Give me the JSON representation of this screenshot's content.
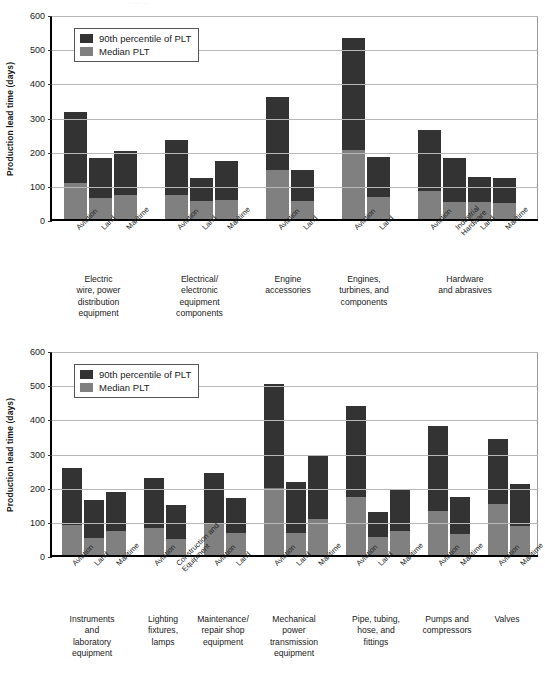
{
  "page": {
    "background": "#ffffff",
    "faint_top_text": "· ···· ··"
  },
  "colors": {
    "percentile90": "#333333",
    "median": "#808080",
    "gridline": "#b8b8b8",
    "axis": "#000000"
  },
  "legend": {
    "series_90": "90th percentile of PLT",
    "series_median": "Median PLT"
  },
  "chart_data": [
    {
      "type": "bar",
      "chart_id": "chart-top",
      "title": "",
      "xlabel": "",
      "ylabel": "Production lead time (days)",
      "ylim": [
        0,
        600
      ],
      "yticks": [
        0,
        100,
        200,
        300,
        400,
        500,
        600
      ],
      "grid": true,
      "stacked_overlay": true,
      "legend_position": "top-left",
      "series": [
        {
          "name": "90th percentile of PLT",
          "color": "#333333"
        },
        {
          "name": "Median PLT",
          "color": "#808080"
        }
      ],
      "groups": [
        {
          "label": "Electric\nwire, power\ndistribution\nequipment",
          "bars": [
            {
              "category": "Aviation",
              "p90": 312,
              "median": 105
            },
            {
              "category": "Land",
              "p90": 178,
              "median": 61
            },
            {
              "category": "Maritime",
              "p90": 198,
              "median": 69
            }
          ]
        },
        {
          "label": "Electrical/\nelectronic\nequipment\ncomponents",
          "bars": [
            {
              "category": "Aviation",
              "p90": 230,
              "median": 71
            },
            {
              "category": "Land",
              "p90": 121,
              "median": 52
            },
            {
              "category": "Maritime",
              "p90": 171,
              "median": 57
            }
          ]
        },
        {
          "label": "Engine\naccessories",
          "bars": [
            {
              "category": "Aviation",
              "p90": 357,
              "median": 143
            },
            {
              "category": "Land",
              "p90": 143,
              "median": 53
            }
          ]
        },
        {
          "label": "Engines,\nturbines, and\ncomponents",
          "bars": [
            {
              "category": "Aviation",
              "p90": 530,
              "median": 203
            },
            {
              "category": "Land",
              "p90": 182,
              "median": 65
            }
          ]
        },
        {
          "label": "Hardware\nand abrasives",
          "bars": [
            {
              "category": "Aviation",
              "p90": 260,
              "median": 83
            },
            {
              "category": "Industrial\nHardware",
              "p90": 180,
              "median": 50
            },
            {
              "category": "Land",
              "p90": 122,
              "median": 50
            },
            {
              "category": "Maritime",
              "p90": 120,
              "median": 47
            }
          ]
        }
      ]
    },
    {
      "type": "bar",
      "chart_id": "chart-bottom",
      "title": "",
      "xlabel": "",
      "ylabel": "Production lead time  (days)",
      "ylim": [
        0,
        600
      ],
      "yticks": [
        0,
        100,
        200,
        300,
        400,
        500,
        600
      ],
      "grid": true,
      "stacked_overlay": true,
      "legend_position": "top-left",
      "series": [
        {
          "name": "90th percentile of PLT",
          "color": "#333333"
        },
        {
          "name": "Median PLT",
          "color": "#808080"
        }
      ],
      "groups": [
        {
          "label": "Instruments\nand\nlaboratory\nequipment",
          "bars": [
            {
              "category": "Aviation",
              "p90": 255,
              "median": 88
            },
            {
              "category": "Land",
              "p90": 160,
              "median": 49
            },
            {
              "category": "Maritime",
              "p90": 183,
              "median": 70
            }
          ]
        },
        {
          "label": "Lighting\nfixtures,\nlamps",
          "bars": [
            {
              "category": "Aviation",
              "p90": 225,
              "median": 80
            },
            {
              "category": "Construction and\nEquipment",
              "p90": 145,
              "median": 48
            }
          ]
        },
        {
          "label": "Maintenance/\nrepair shop\nequipment",
          "bars": [
            {
              "category": "Aviation",
              "p90": 241,
              "median": 90
            },
            {
              "category": "Land",
              "p90": 166,
              "median": 63
            }
          ]
        },
        {
          "label": "Mechanical\npower\ntransmission\nequipment",
          "bars": [
            {
              "category": "Aviation",
              "p90": 501,
              "median": 197
            },
            {
              "category": "Land",
              "p90": 213,
              "median": 64
            },
            {
              "category": "Maritime",
              "p90": 290,
              "median": 106
            }
          ]
        },
        {
          "label": "Pipe, tubing,\nhose, and\nfittings",
          "bars": [
            {
              "category": "Aviation",
              "p90": 435,
              "median": 171
            },
            {
              "category": "Land",
              "p90": 125,
              "median": 52
            },
            {
              "category": "Maritime",
              "p90": 191,
              "median": 69
            }
          ]
        },
        {
          "label": "Pumps and\ncompressors",
          "bars": [
            {
              "category": "Aviation",
              "p90": 378,
              "median": 128
            },
            {
              "category": "Maritime",
              "p90": 171,
              "median": 62
            }
          ]
        },
        {
          "label": "Valves",
          "bars": [
            {
              "category": "Aviation",
              "p90": 339,
              "median": 149
            },
            {
              "category": "Maritime",
              "p90": 209,
              "median": 85
            }
          ]
        }
      ]
    }
  ]
}
